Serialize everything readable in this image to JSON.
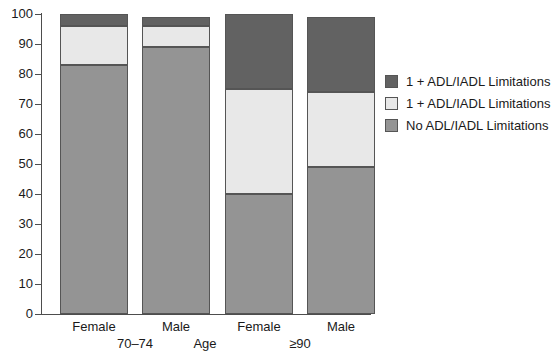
{
  "chart_data": {
    "type": "bar",
    "stacked": true,
    "title": "",
    "xlabel": "Age",
    "ylabel": "",
    "ylim": [
      0,
      100
    ],
    "yticks": [
      0,
      10,
      20,
      30,
      40,
      50,
      60,
      70,
      80,
      90,
      100
    ],
    "grid": false,
    "legend_position": "right",
    "categories": [
      "Female",
      "Male",
      "Female",
      "Male"
    ],
    "groups": [
      {
        "label": "70–74",
        "categories": [
          "Female",
          "Male"
        ]
      },
      {
        "label": "≥90",
        "categories": [
          "Female",
          "Male"
        ]
      }
    ],
    "series": [
      {
        "name": "No ADL/IADL Limitations",
        "color": "#949494",
        "values": [
          83,
          89,
          40,
          49
        ]
      },
      {
        "name": "1 + ADL/IADL Limitations",
        "color": "#e8e8e8",
        "values": [
          13,
          7,
          35,
          25
        ]
      },
      {
        "name": "1 + ADL/IADL Limitations",
        "color": "#626262",
        "values": [
          4,
          3,
          25,
          25
        ]
      }
    ],
    "bar_totals": [
      100,
      99,
      100,
      99
    ]
  },
  "axis": {
    "x_title": "Age",
    "y_tick_labels": [
      "0",
      "10",
      "20",
      "30",
      "40",
      "50",
      "60",
      "70",
      "80",
      "90",
      "100"
    ],
    "category_labels": [
      "Female",
      "Male",
      "Female",
      "Male"
    ],
    "group_labels": [
      "70–74",
      "≥90"
    ]
  },
  "legend": {
    "items": [
      {
        "label": "1 + ADL/IADL Limitations",
        "color": "#626262"
      },
      {
        "label": "1 + ADL/IADL Limitations",
        "color": "#e8e8e8"
      },
      {
        "label": "No ADL/IADL Limitations",
        "color": "#949494"
      }
    ]
  },
  "colors": {
    "dark": "#626262",
    "light": "#e8e8e8",
    "medium": "#949494",
    "axis": "#4d4d4d",
    "text": "#1a1a1a",
    "background": "#ffffff"
  }
}
